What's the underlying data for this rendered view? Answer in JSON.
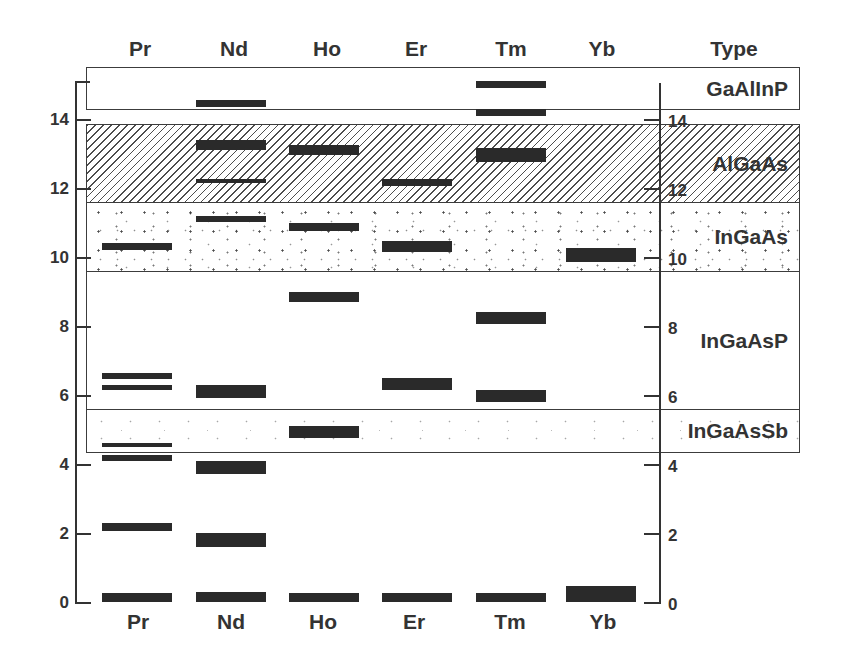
{
  "chart_data": {
    "type": "bar",
    "title": "",
    "xlabel": "",
    "ylabel": "",
    "categories": [
      "Pr",
      "Nd",
      "Ho",
      "Er",
      "Tm",
      "Yb"
    ],
    "type_header": "Type",
    "ylim": [
      0,
      15.5
    ],
    "axis_range": [
      0,
      15.1
    ],
    "yticks": [
      0,
      2,
      4,
      6,
      8,
      10,
      12,
      14
    ],
    "y_axes": [
      "left",
      "right"
    ],
    "grid": false,
    "legend": "none",
    "series": [
      {
        "name": "Pr",
        "levels": [
          [
            0,
            0.25
          ],
          [
            2.05,
            2.3
          ],
          [
            4.1,
            4.25
          ],
          [
            4.5,
            4.6
          ],
          [
            6.15,
            6.3
          ],
          [
            6.45,
            6.65
          ],
          [
            10.2,
            10.4
          ]
        ]
      },
      {
        "name": "Nd",
        "levels": [
          [
            0,
            0.3
          ],
          [
            1.6,
            2.0
          ],
          [
            3.7,
            4.1
          ],
          [
            5.9,
            6.3
          ],
          [
            11.0,
            11.2
          ],
          [
            12.15,
            12.25
          ],
          [
            13.1,
            13.4
          ],
          [
            14.35,
            14.55
          ]
        ]
      },
      {
        "name": "Ho",
        "levels": [
          [
            0,
            0.25
          ],
          [
            4.75,
            5.1
          ],
          [
            8.7,
            9.0
          ],
          [
            10.75,
            11.0
          ],
          [
            12.95,
            13.25
          ]
        ]
      },
      {
        "name": "Er",
        "levels": [
          [
            0,
            0.25
          ],
          [
            6.15,
            6.5
          ],
          [
            10.15,
            10.45
          ],
          [
            12.05,
            12.25
          ]
        ]
      },
      {
        "name": "Tm",
        "levels": [
          [
            0,
            0.25
          ],
          [
            5.8,
            6.15
          ],
          [
            8.05,
            8.4
          ],
          [
            12.75,
            13.15
          ],
          [
            14.1,
            14.3
          ],
          [
            14.9,
            15.1
          ]
        ]
      },
      {
        "name": "Yb",
        "levels": [
          [
            0,
            0.45
          ],
          [
            9.85,
            10.25
          ]
        ]
      }
    ],
    "regions": [
      {
        "name": "GaAlInP",
        "range": [
          14.3,
          15.5
        ],
        "pattern": "none"
      },
      {
        "name": "AlGaAs",
        "range": [
          11.6,
          13.85
        ],
        "pattern": "hatch"
      },
      {
        "name": "InGaAs",
        "range": [
          9.6,
          11.6
        ],
        "pattern": "stipple"
      },
      {
        "name": "InGaAsP",
        "range": [
          5.6,
          9.6
        ],
        "pattern": "none"
      },
      {
        "name": "InGaAsSb",
        "range": [
          4.35,
          5.6
        ],
        "pattern": "stipple-light"
      }
    ],
    "colors": {
      "bar": "#2a2a2a",
      "axis": "#333333",
      "text": "#333333",
      "hatch": "#4d4d4d"
    }
  }
}
